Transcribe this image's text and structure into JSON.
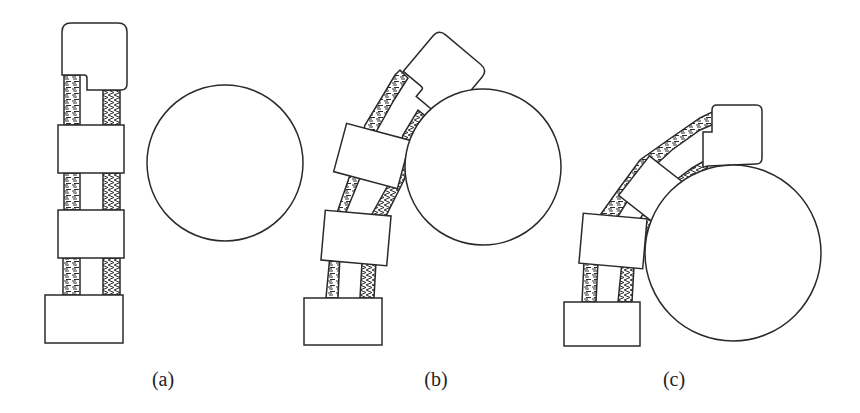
{
  "figure": {
    "colors": {
      "stroke": "#2a2a2a",
      "fill": "#ffffff",
      "background": "#ffffff"
    },
    "panels": [
      {
        "id": "a",
        "label": "(a)",
        "state": "straight finger, object separated"
      },
      {
        "id": "b",
        "label": "(b)",
        "state": "finger partially bent, contacting object"
      },
      {
        "id": "c",
        "label": "(c)",
        "state": "finger fully wrapped around object"
      }
    ]
  }
}
